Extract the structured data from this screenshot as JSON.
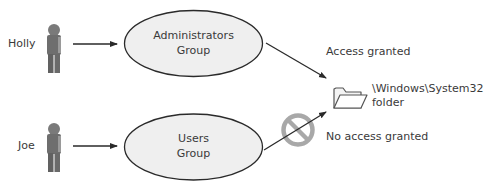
{
  "diagram": {
    "users": [
      {
        "name": "Holly",
        "icon": "person-icon"
      },
      {
        "name": "Joe",
        "icon": "person-icon"
      }
    ],
    "groups": [
      {
        "line1": "Administrators",
        "line2": "Group"
      },
      {
        "line1": "Users",
        "line2": "Group"
      }
    ],
    "resource": {
      "icon": "folder-icon",
      "line1": "\\Windows\\System32",
      "line2": "folder"
    },
    "access": {
      "granted_label": "Access granted",
      "denied_label": "No access granted",
      "denied_icon": "prohibited-icon"
    },
    "colors": {
      "ellipse_fill": "#efefef",
      "ellipse_stroke": "#2a2a2a",
      "arrow": "#2a2a2a",
      "person": "#6e6e6e",
      "prohibit": "#a8a8a8",
      "folder_stroke": "#555555"
    }
  }
}
